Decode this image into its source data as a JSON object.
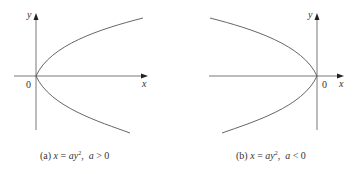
{
  "figures": [
    {
      "id": "a",
      "caption": {
        "tag": "(a)",
        "equation_lhs": "x",
        "equation_rhs_coef": "a",
        "equation_rhs_var": "y",
        "exponent": "2",
        "condition": "a > 0",
        "condition_var": "a",
        "condition_op": " > 0"
      },
      "axis_labels": {
        "x": "x",
        "y": "y",
        "origin": "0"
      },
      "opens": "right"
    },
    {
      "id": "b",
      "caption": {
        "tag": "(b)",
        "equation_lhs": "x",
        "equation_rhs_coef": "a",
        "equation_rhs_var": "y",
        "exponent": "2",
        "condition": "a < 0",
        "condition_var": "a",
        "condition_op": " < 0"
      },
      "axis_labels": {
        "x": "x",
        "y": "y",
        "origin": "0"
      },
      "opens": "left"
    }
  ],
  "colors": {
    "axis": "#555555",
    "curve": "#555555",
    "text": "#333333"
  }
}
